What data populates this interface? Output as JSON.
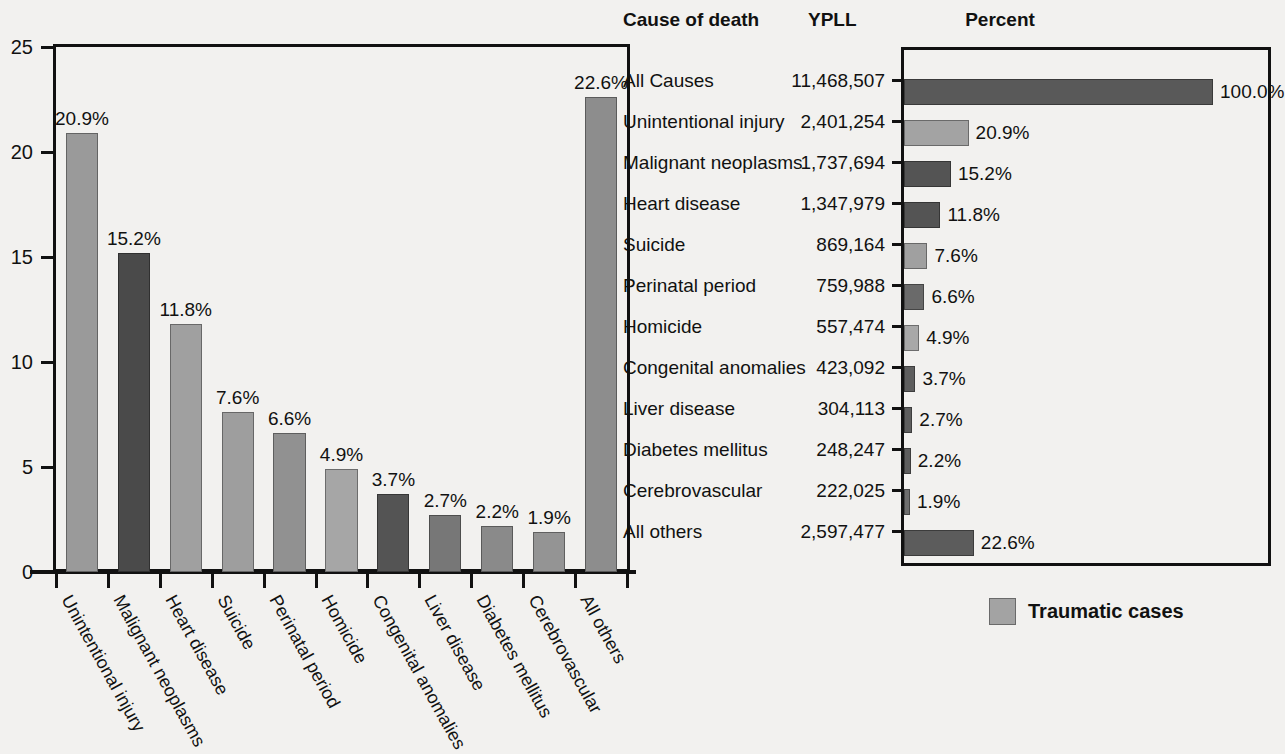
{
  "chart_data": [
    {
      "type": "bar",
      "orientation": "vertical",
      "title": "",
      "xlabel": "",
      "ylabel": "",
      "ylim": [
        0,
        25
      ],
      "yticks": [
        0,
        5,
        10,
        15,
        20,
        25
      ],
      "grid": false,
      "categories": [
        "Unintentional injury",
        "Malignant neoplasms",
        "Heart disease",
        "Suicide",
        "Perinatal period",
        "Homicide",
        "Congenital anomalies",
        "Liver disease",
        "Diabetes mellitus",
        "Cerebrovascular",
        "All others"
      ],
      "values": [
        20.9,
        15.2,
        11.8,
        7.6,
        6.6,
        4.9,
        3.7,
        2.7,
        2.2,
        1.9,
        22.6
      ],
      "data_labels": [
        "20.9%",
        "15.2%",
        "11.8%",
        "7.6%",
        "6.6%",
        "4.9%",
        "3.7%",
        "2.7%",
        "2.2%",
        "1.9%",
        "22.6%"
      ],
      "traumatic": [
        true,
        false,
        false,
        true,
        false,
        true,
        false,
        false,
        false,
        false,
        false
      ],
      "bar_colors": [
        "#9a9a9a",
        "#4a4a4a",
        "#a0a0a0",
        "#9e9e9e",
        "#919191",
        "#a6a6a6",
        "#545454",
        "#777777",
        "#8a8a8a",
        "#949494",
        "#8d8d8d"
      ]
    },
    {
      "type": "bar",
      "orientation": "horizontal",
      "title": "Percent",
      "xlabel": "",
      "ylabel": "",
      "xlim": [
        0,
        100
      ],
      "grid": false,
      "categories": [
        "All Causes",
        "Unintentional injury",
        "Malignant neoplasms",
        "Heart disease",
        "Suicide",
        "Perinatal period",
        "Homicide",
        "Congenital anomalies",
        "Liver disease",
        "Diabetes mellitus",
        "Cerebrovascular",
        "All others"
      ],
      "values": [
        100.0,
        20.9,
        15.2,
        11.8,
        7.6,
        6.6,
        4.9,
        3.7,
        2.7,
        2.2,
        1.9,
        22.6
      ],
      "data_labels": [
        "100.0%",
        "20.9%",
        "15.2%",
        "11.8%",
        "7.6%",
        "6.6%",
        "4.9%",
        "3.7%",
        "2.7%",
        "2.2%",
        "1.9%",
        "22.6%"
      ],
      "traumatic": [
        false,
        true,
        false,
        false,
        true,
        false,
        true,
        false,
        false,
        false,
        false,
        false
      ],
      "bar_colors": [
        "#595959",
        "#a3a3a3",
        "#545454",
        "#545454",
        "#a0a0a0",
        "#6a6a6a",
        "#a8a8a8",
        "#5e5e5e",
        "#5e5e5e",
        "#5e5e5e",
        "#6e6e6e",
        "#5c5c5c"
      ]
    }
  ],
  "table": {
    "headers": {
      "cause": "Cause of death",
      "ypll": "YPLL"
    },
    "rows": [
      {
        "cause": "All Causes",
        "ypll": "11,468,507"
      },
      {
        "cause": "Unintentional injury",
        "ypll": "2,401,254"
      },
      {
        "cause": "Malignant neoplasms",
        "ypll": "1,737,694"
      },
      {
        "cause": "Heart disease",
        "ypll": "1,347,979"
      },
      {
        "cause": "Suicide",
        "ypll": "869,164"
      },
      {
        "cause": "Perinatal period",
        "ypll": "759,988"
      },
      {
        "cause": "Homicide",
        "ypll": "557,474"
      },
      {
        "cause": "Congenital anomalies",
        "ypll": "423,092"
      },
      {
        "cause": "Liver disease",
        "ypll": "304,113"
      },
      {
        "cause": "Diabetes mellitus",
        "ypll": "248,247"
      },
      {
        "cause": "Cerebrovascular",
        "ypll": "222,025"
      },
      {
        "cause": "All others",
        "ypll": "2,597,477"
      }
    ]
  },
  "percent_title": "Percent",
  "legend": {
    "label": "Traumatic cases",
    "color": "#a3a3a3"
  },
  "colors": {
    "axis": "#111111",
    "background": "#f2f1ef",
    "traumatic": "#a3a3a3",
    "nontraumatic": "#555555"
  }
}
